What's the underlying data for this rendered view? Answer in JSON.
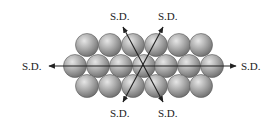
{
  "diagram": {
    "labels": {
      "top_left": "S.D.",
      "top_right": "S.D.",
      "left": "S.D.",
      "right": "S.D.",
      "bottom_left": "S.D.",
      "bottom_right": "S.D."
    },
    "colors": {
      "sphere_light": "#d9d9d9",
      "sphere_mid": "#a8a8a8",
      "sphere_dark": "#6e6e6e",
      "line": "#222222",
      "background": "#ffffff"
    },
    "spheres": {
      "radius": 11.5,
      "rows": [
        {
          "y": 45,
          "x": [
            87,
            110,
            133,
            156,
            179,
            201
          ]
        },
        {
          "y": 66,
          "x": [
            75,
            98,
            121,
            144,
            166,
            189,
            212
          ]
        },
        {
          "y": 86,
          "x": [
            87,
            110,
            133,
            156,
            179,
            201
          ]
        }
      ]
    }
  }
}
